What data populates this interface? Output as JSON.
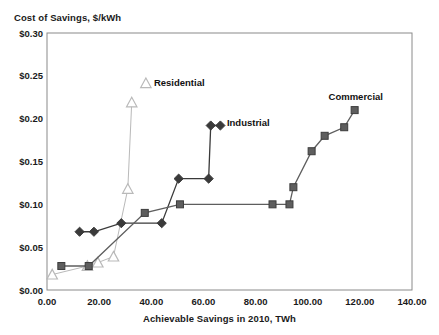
{
  "chart_data": {
    "type": "line",
    "title": "",
    "ylabel": "Cost of Savings, $/kWh",
    "xlabel": "Achievable Savings in 2010, TWh",
    "xlim": [
      0,
      140
    ],
    "ylim": [
      0,
      0.3
    ],
    "grid": false,
    "legend_position": "inline-data-labels",
    "xticks": [
      "0.00",
      "20.00",
      "40.00",
      "60.00",
      "80.00",
      "100.00",
      "120.00",
      "140.00"
    ],
    "xtick_values": [
      0,
      20,
      40,
      60,
      80,
      100,
      120,
      140
    ],
    "yticks": [
      "$0.00",
      "$0.05",
      "$0.10",
      "$0.15",
      "$0.20",
      "$0.25",
      "$0.30"
    ],
    "ytick_values": [
      0,
      0.05,
      0.1,
      0.15,
      0.2,
      0.25,
      0.3
    ],
    "series": [
      {
        "name": "Residential",
        "marker": "triangle",
        "color": "#b9b9b9",
        "label_x": 41,
        "label_y": 0.238,
        "points": [
          {
            "x": 2.0,
            "y": 0.018
          },
          {
            "x": 15.5,
            "y": 0.028
          },
          {
            "x": 19.5,
            "y": 0.032
          },
          {
            "x": 25.5,
            "y": 0.039
          },
          {
            "x": 31.0,
            "y": 0.118
          },
          {
            "x": 32.5,
            "y": 0.219
          }
        ]
      },
      {
        "name": "Industrial",
        "marker": "diamond",
        "color": "#3a3a3a",
        "label_x": 69,
        "label_y": 0.192,
        "points": [
          {
            "x": 12.5,
            "y": 0.068
          },
          {
            "x": 18.0,
            "y": 0.068
          },
          {
            "x": 28.5,
            "y": 0.078
          },
          {
            "x": 44.0,
            "y": 0.078
          },
          {
            "x": 50.5,
            "y": 0.13
          },
          {
            "x": 62.0,
            "y": 0.13
          },
          {
            "x": 62.8,
            "y": 0.192
          },
          {
            "x": 66.5,
            "y": 0.192
          }
        ]
      },
      {
        "name": "Commercial",
        "marker": "square",
        "color": "#5e5e5e",
        "label_x": 108,
        "label_y": 0.222,
        "points": [
          {
            "x": 5.5,
            "y": 0.028
          },
          {
            "x": 16.0,
            "y": 0.028
          },
          {
            "x": 37.5,
            "y": 0.09
          },
          {
            "x": 51.0,
            "y": 0.1
          },
          {
            "x": 86.5,
            "y": 0.1
          },
          {
            "x": 93.0,
            "y": 0.1
          },
          {
            "x": 94.5,
            "y": 0.12
          },
          {
            "x": 101.5,
            "y": 0.162
          },
          {
            "x": 106.5,
            "y": 0.18
          },
          {
            "x": 114.0,
            "y": 0.19
          },
          {
            "x": 118.0,
            "y": 0.21
          }
        ]
      }
    ]
  }
}
